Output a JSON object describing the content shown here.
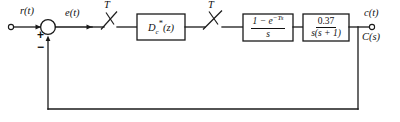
{
  "diagram": {
    "type": "block-diagram",
    "background_color": "#ffffff",
    "line_color": "#1a1a1a"
  },
  "signals": {
    "input_label": "r(t)",
    "error_label": "e(t)",
    "output_label_time": "c(t)",
    "output_label_laplace": "C(s)"
  },
  "summing_junction": {
    "name": "summing-junction",
    "positive_sign": "+",
    "negative_sign": "−"
  },
  "samplers": [
    {
      "name": "input-sampler",
      "period_label": "T"
    },
    {
      "name": "controller-output-sampler",
      "period_label": "T"
    }
  ],
  "blocks": [
    {
      "name": "digital-controller",
      "kind": "controller",
      "text": "Dc*(z)",
      "base": "D",
      "subscript": "c",
      "superscript": "*",
      "argument": "(z)"
    },
    {
      "name": "zero-order-hold",
      "kind": "hold",
      "text": "(1 - e^-Ts)/s",
      "numerator": "1 − e",
      "numerator_exponent": "−Ts",
      "denominator": "s"
    },
    {
      "name": "plant",
      "kind": "plant",
      "text": "0.37/(s(s+1))",
      "numerator": "0.37",
      "denominator": "s(s + 1)"
    }
  ],
  "feedback": {
    "name": "unity-feedback-path",
    "gain": "1",
    "description": "unity feedback from output node to negative input of summing junction"
  }
}
